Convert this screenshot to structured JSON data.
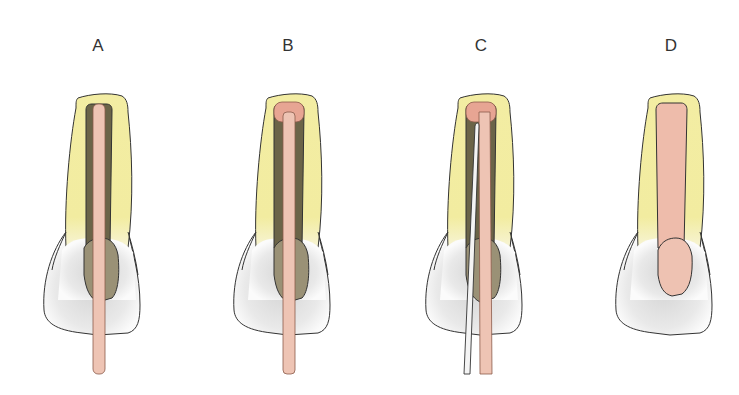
{
  "figure": {
    "panels": [
      {
        "label": "A"
      },
      {
        "label": "B"
      },
      {
        "label": "C"
      },
      {
        "label": "D"
      }
    ]
  },
  "colors": {
    "root_yellow": "#f2eca0",
    "crown_white": "#f7f7f7",
    "crown_shadow": "#d9d9d9",
    "canal_dark": "#6b6448",
    "pulp_chamber": "#9a9176",
    "post_pink": "#eec4b4",
    "post_head": "#e7a593",
    "wire_white": "#f4f4f4",
    "outline": "#333333"
  }
}
